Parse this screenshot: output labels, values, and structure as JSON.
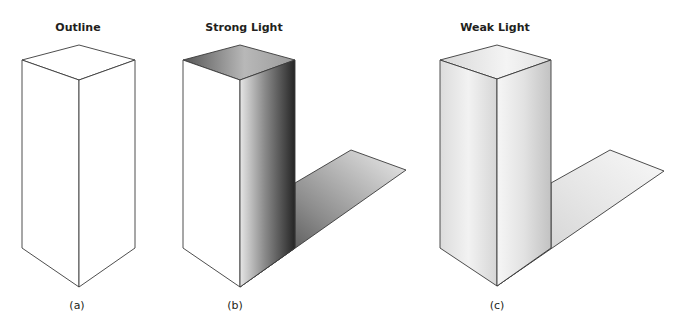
{
  "figure": {
    "panels": [
      {
        "title": "Outline",
        "caption": "(a)",
        "shading": "none"
      },
      {
        "title": "Strong Light",
        "caption": "(b)",
        "shading": "strong"
      },
      {
        "title": "Weak Light",
        "caption": "(c)",
        "shading": "weak"
      }
    ],
    "colors": {
      "stroke": "#3a3a3a",
      "background": "#ffffff",
      "strong_dark": "#2a2a2a",
      "strong_light": "#e8e8e8",
      "weak_dark": "#c4c4c4",
      "weak_light": "#f4f4f4"
    }
  }
}
